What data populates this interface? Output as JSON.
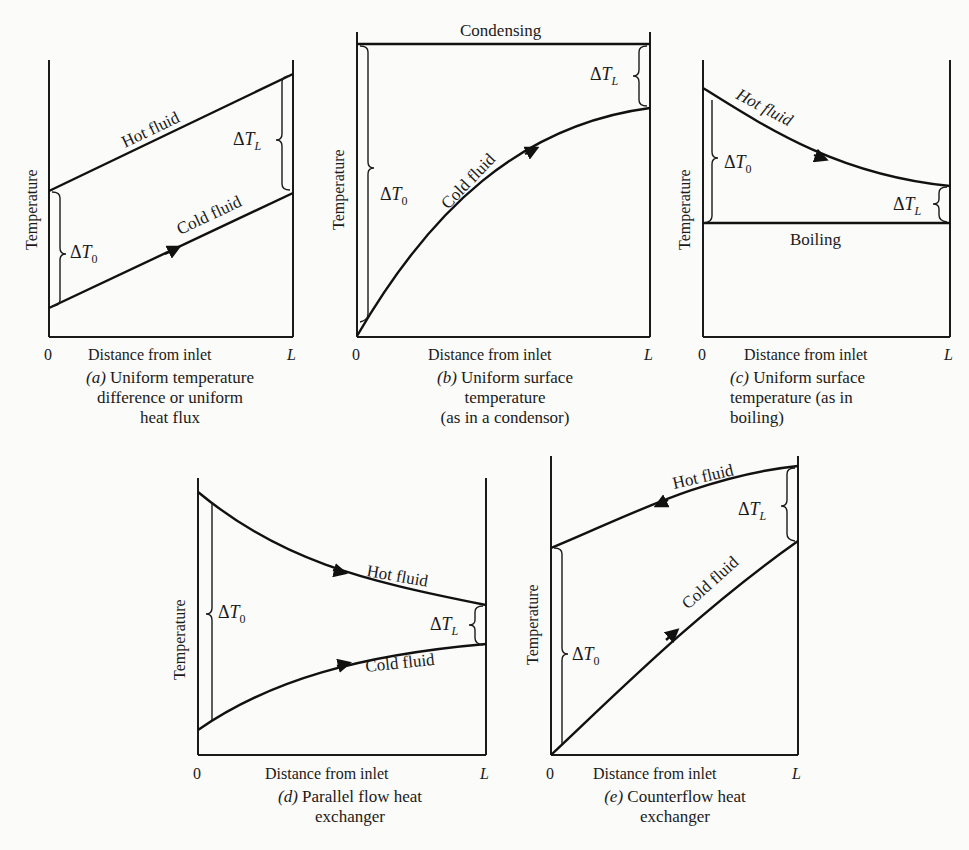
{
  "figure": {
    "panels": [
      {
        "id": "a",
        "caption_tag": "(a)",
        "caption_lines": [
          "Uniform temperature",
          "difference or uniform",
          "heat flux"
        ],
        "ylabel": "Temperature",
        "xlabel": "Distance from inlet",
        "x_start": "0",
        "x_end": "L",
        "curves": [
          {
            "label": "Hot fluid",
            "shape": "linear increasing"
          },
          {
            "label": "Cold fluid",
            "shape": "linear increasing",
            "arrow": "forward"
          }
        ],
        "delta_labels": [
          "ΔT0",
          "ΔTL"
        ]
      },
      {
        "id": "b",
        "caption_tag": "(b)",
        "caption_lines": [
          "Uniform surface",
          "temperature",
          "(as in a condensor)"
        ],
        "ylabel": "Temperature",
        "xlabel": "Distance from inlet",
        "x_start": "0",
        "x_end": "L",
        "top_label": "Condensing",
        "curves": [
          {
            "label": "Condensing",
            "shape": "constant"
          },
          {
            "label": "Cold fluid",
            "shape": "concave increasing",
            "arrow": "forward"
          }
        ],
        "delta_labels": [
          "ΔT0",
          "ΔTL"
        ]
      },
      {
        "id": "c",
        "caption_tag": "(c)",
        "caption_lines": [
          "Uniform surface",
          "temperature (as in",
          "boiling)"
        ],
        "ylabel": "Temperature",
        "xlabel": "Distance from inlet",
        "x_start": "0",
        "x_end": "L",
        "curves": [
          {
            "label": "Hot fluid",
            "shape": "convex decreasing",
            "arrow": "forward"
          },
          {
            "label": "Boiling",
            "shape": "constant"
          }
        ],
        "delta_labels": [
          "ΔT0",
          "ΔTL"
        ]
      },
      {
        "id": "d",
        "caption_tag": "(d)",
        "caption_lines": [
          "Parallel flow heat",
          "exchanger"
        ],
        "ylabel": "Temperature",
        "xlabel": "Distance from inlet",
        "x_start": "0",
        "x_end": "L",
        "curves": [
          {
            "label": "Hot fluid",
            "shape": "decreasing",
            "arrow": "forward"
          },
          {
            "label": "Cold fluid",
            "shape": "increasing",
            "arrow": "forward"
          }
        ],
        "delta_labels": [
          "ΔT0",
          "ΔTL"
        ]
      },
      {
        "id": "e",
        "caption_tag": "(e)",
        "caption_lines": [
          "Counterflow heat",
          "exchanger"
        ],
        "ylabel": "Temperature",
        "xlabel": "Distance from inlet",
        "x_start": "0",
        "x_end": "L",
        "curves": [
          {
            "label": "Hot fluid",
            "shape": "increasing",
            "arrow": "backward"
          },
          {
            "label": "Cold fluid",
            "shape": "increasing",
            "arrow": "forward"
          }
        ],
        "delta_labels": [
          "ΔT0",
          "ΔTL"
        ]
      }
    ]
  },
  "text": {
    "temperature": "Temperature",
    "distance": "Distance from inlet",
    "zero": "0",
    "L": "L",
    "hot": "Hot fluid",
    "cold": "Cold fluid",
    "condensing": "Condensing",
    "boiling": "Boiling",
    "delta": "Δ",
    "T": "T",
    "sub0": "0",
    "subL": "L"
  },
  "captions": {
    "a": {
      "tag": "(a)",
      "l1": " Uniform temperature",
      "l2": "difference or uniform",
      "l3": "heat flux"
    },
    "b": {
      "tag": "(b)",
      "l1": " Uniform surface",
      "l2": "temperature",
      "l3": "(as in a condensor)"
    },
    "c": {
      "tag": "(c)",
      "l1": " Uniform surface",
      "l2": "temperature (as in",
      "l3": "boiling)"
    },
    "d": {
      "tag": "(d)",
      "l1": " Parallel flow heat",
      "l2": "exchanger"
    },
    "e": {
      "tag": "(e)",
      "l1": " Counterflow heat",
      "l2": "exchanger"
    }
  }
}
